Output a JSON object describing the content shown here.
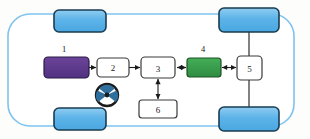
{
  "diagram": {
    "body": {
      "name": "vehicle-body-outline",
      "stroke": "#7ec3ef",
      "fill": "#ffffff",
      "x": 8,
      "y": 14,
      "width": 286,
      "height": 112,
      "radius": 22,
      "stroke_width": 1.6
    },
    "wheels": [
      {
        "name": "wheel-front-left",
        "label": "",
        "x": 54,
        "y": 10,
        "width": 52,
        "height": 22,
        "radius": 5
      },
      {
        "name": "wheel-rear-left",
        "label": "",
        "x": 219,
        "y": 8,
        "width": 60,
        "height": 24,
        "radius": 5
      },
      {
        "name": "wheel-front-right",
        "label": "",
        "x": 54,
        "y": 108,
        "width": 52,
        "height": 22,
        "radius": 5
      },
      {
        "name": "wheel-rear-right",
        "label": "",
        "x": 219,
        "y": 107,
        "width": 60,
        "height": 24,
        "radius": 5
      }
    ],
    "wheel_style": {
      "fill": "#5cb3e8",
      "fill_light": "#8fcdf1",
      "stroke": "#1a3d52",
      "stroke_width": 1.6
    },
    "components": [
      {
        "id": "1",
        "name": "component-1-battery",
        "label": "",
        "callout": "1",
        "x": 44,
        "y": 57,
        "width": 45,
        "height": 21,
        "radius": 4,
        "fill": "#5d3a8e",
        "stroke": "#2a1b45",
        "text_color": "#ffffff",
        "callout_x": 64,
        "callout_y": 52
      },
      {
        "id": "2",
        "name": "component-2-converter",
        "label": "2",
        "callout": "",
        "x": 97,
        "y": 58,
        "width": 32,
        "height": 19,
        "radius": 4,
        "fill": "#ffffff",
        "stroke": "#3a3a3a",
        "text_color": "#1a1a1a",
        "callout_x": 0,
        "callout_y": 0
      },
      {
        "id": "3",
        "name": "component-3-inverter",
        "label": "3",
        "callout": "",
        "x": 141,
        "y": 57,
        "width": 34,
        "height": 21,
        "radius": 4,
        "fill": "#ffffff",
        "stroke": "#3a3a3a",
        "text_color": "#1a1a1a",
        "callout_x": 0,
        "callout_y": 0
      },
      {
        "id": "4",
        "name": "component-4-motor",
        "label": "",
        "callout": "4",
        "x": 187,
        "y": 58,
        "width": 34,
        "height": 19,
        "radius": 3,
        "fill": "#3a9e4e",
        "stroke": "#1d5228",
        "text_color": "#ffffff",
        "callout_x": 203,
        "callout_y": 52
      },
      {
        "id": "5",
        "name": "component-5-differential",
        "label": "5",
        "callout": "",
        "x": 237,
        "y": 56,
        "width": 25,
        "height": 24,
        "radius": 4,
        "fill": "#ffffff",
        "stroke": "#3a3a3a",
        "text_color": "#1a1a1a",
        "callout_x": 0,
        "callout_y": 0
      },
      {
        "id": "6",
        "name": "component-6-controller",
        "label": "6",
        "callout": "",
        "x": 139,
        "y": 100,
        "width": 38,
        "height": 18,
        "radius": 3,
        "fill": "#ffffff",
        "stroke": "#3a3a3a",
        "text_color": "#1a1a1a",
        "callout_x": 0,
        "callout_y": 0
      }
    ],
    "connections": [
      {
        "name": "arrow-1-to-2",
        "from": "1",
        "to": "2",
        "x1": 89,
        "y1": 67.5,
        "x2": 96,
        "y2": 67.5,
        "heads": "single",
        "orientation": "horizontal"
      },
      {
        "name": "arrow-2-to-3",
        "from": "2",
        "to": "3",
        "x1": 129,
        "y1": 67.5,
        "x2": 140,
        "y2": 67.5,
        "heads": "single",
        "orientation": "horizontal"
      },
      {
        "name": "arrow-3-to-4",
        "from": "3",
        "to": "4",
        "x1": 176,
        "y1": 67.5,
        "x2": 186,
        "y2": 67.5,
        "heads": "double",
        "orientation": "horizontal"
      },
      {
        "name": "arrow-4-to-5",
        "from": "4",
        "to": "5",
        "x1": 221,
        "y1": 67.5,
        "x2": 236,
        "y2": 67.5,
        "heads": "double",
        "orientation": "horizontal"
      },
      {
        "name": "arrow-3-to-6",
        "from": "3",
        "to": "6",
        "x1": 158,
        "y1": 79,
        "x2": 158,
        "y2": 99,
        "heads": "double",
        "orientation": "vertical"
      }
    ],
    "axles": [
      {
        "name": "axle-upper-rear",
        "x1": 249,
        "y1": 32,
        "x2": 249,
        "y2": 56
      },
      {
        "name": "axle-lower-rear",
        "x1": 249,
        "y1": 80,
        "x2": 249,
        "y2": 107
      }
    ],
    "steering_wheel": {
      "name": "steering-wheel-icon",
      "cx": 107,
      "cy": 95,
      "outer_radius": 11,
      "inner_radius": 8,
      "hub_radius": 2.2,
      "stroke": "#1a1a1a",
      "fill": "#ffffff",
      "spoke_fill": "#2f6f9e"
    },
    "line_style": {
      "stroke": "#1a1a1a",
      "stroke_width": 1.1,
      "arrow_size": 3.4
    }
  }
}
